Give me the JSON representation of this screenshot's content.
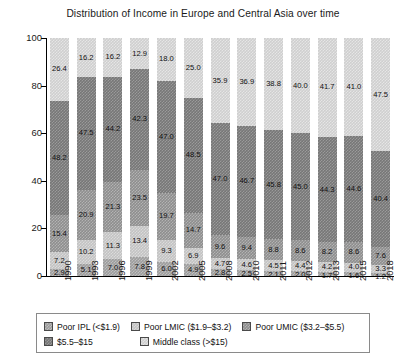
{
  "chart_data": {
    "type": "bar",
    "stacked": true,
    "title": "Distribution of Income in Europe and Central Asia over time",
    "xlabel": "",
    "ylabel": "Population share in each income category (%)",
    "ylim": [
      0,
      100
    ],
    "yticks": [
      0,
      20,
      40,
      60,
      80,
      100
    ],
    "grid": false,
    "legend_position": "bottom",
    "categories": [
      "1990",
      "1993",
      "1996",
      "1999",
      "2002",
      "2005",
      "2008",
      "2010",
      "2011",
      "2012",
      "2013",
      "2015",
      "2018"
    ],
    "series": [
      {
        "name": "Poor IPL (<$1.9)",
        "values": [
          2.9,
          5.1,
          7.0,
          7.8,
          6.0,
          4.9,
          2.8,
          2.5,
          2.1,
          2.0,
          1.7,
          1.6,
          1.2
        ]
      },
      {
        "name": "Poor LMIC ($1.9–$3.2)",
        "values": [
          7.2,
          10.2,
          11.3,
          13.4,
          9.3,
          6.9,
          4.7,
          4.6,
          4.5,
          4.4,
          4.2,
          4.0,
          3.3
        ]
      },
      {
        "name": "Poor UMIC ($3.2–$5.5)",
        "values": [
          15.4,
          20.9,
          21.3,
          23.5,
          19.7,
          14.7,
          9.6,
          9.4,
          8.8,
          8.6,
          8.2,
          8.6,
          7.6
        ]
      },
      {
        "name": "$5.5–$15",
        "values": [
          48.2,
          47.5,
          44.2,
          42.3,
          47.0,
          48.5,
          47.0,
          46.7,
          45.8,
          45.0,
          44.3,
          44.6,
          40.4
        ]
      },
      {
        "name": "Middle class (>$15)",
        "values": [
          26.4,
          16.2,
          16.2,
          12.9,
          18.0,
          25.0,
          35.9,
          36.9,
          38.8,
          40.0,
          41.7,
          41.0,
          47.5
        ]
      }
    ]
  },
  "legend": {
    "items": [
      {
        "label": "Poor IPL (<$1.9)",
        "color": "#9d9d9d"
      },
      {
        "label": "Poor LMIC ($1.9–$3.2)",
        "color": "#c3c3c3"
      },
      {
        "label": "Poor UMIC ($3.2–$5.5)",
        "color": "#8e8e8e"
      },
      {
        "label": "$5.5–$15",
        "color": "#777777"
      },
      {
        "label": "Middle class (>$15)",
        "color": "#cfcfcf"
      }
    ]
  }
}
